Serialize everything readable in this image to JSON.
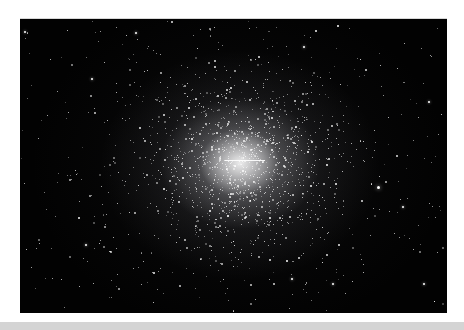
{
  "image": {
    "subject": "globular star cluster",
    "description": "Dense bright star cluster centered on a black starfield background",
    "colors": {
      "page_background": "#ffffff",
      "sky_background": "#020202",
      "core": "#f2f2f2",
      "star": "#ffffff",
      "bottom_bar": "#d4d4d4"
    },
    "bright_stars": [
      {
        "x": 378,
        "y": 186,
        "size": 3
      },
      {
        "x": 424,
        "y": 283,
        "size": 2
      },
      {
        "x": 92,
        "y": 78,
        "size": 2
      },
      {
        "x": 429,
        "y": 101,
        "size": 2
      },
      {
        "x": 333,
        "y": 283,
        "size": 2
      },
      {
        "x": 292,
        "y": 278,
        "size": 2
      },
      {
        "x": 25,
        "y": 31,
        "size": 2
      },
      {
        "x": 136,
        "y": 32,
        "size": 2
      },
      {
        "x": 304,
        "y": 46,
        "size": 2
      },
      {
        "x": 86,
        "y": 244,
        "size": 2
      },
      {
        "x": 403,
        "y": 206,
        "size": 2
      }
    ]
  }
}
